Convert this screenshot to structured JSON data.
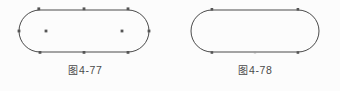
{
  "page": {
    "background_color": "#fcfcfc",
    "ink_color": "#4a4a4a",
    "marker_color": "#555555"
  },
  "figures": [
    {
      "caption_cjk": "图",
      "caption_number": "4-77",
      "caption_full": "图 4-77",
      "shape": "stadium",
      "description": "rounded-end rectangle (stadium) with boundary point markers and two interior square markers",
      "geometry": {
        "left_center_x": 40,
        "right_center_x": 128,
        "center_y": 31,
        "radius": 21,
        "stroke_width": 1
      },
      "boundary_markers": [
        {
          "name": "top-left-tangent",
          "x": 40,
          "y": 10
        },
        {
          "name": "top-middle",
          "x": 84,
          "y": 10
        },
        {
          "name": "top-right-tangent",
          "x": 128,
          "y": 10
        },
        {
          "name": "right-arc-extreme",
          "x": 149,
          "y": 31
        },
        {
          "name": "bottom-right-tangent",
          "x": 128,
          "y": 52
        },
        {
          "name": "bottom-middle",
          "x": 84,
          "y": 52
        },
        {
          "name": "bottom-left-tangent",
          "x": 40,
          "y": 52
        },
        {
          "name": "left-arc-extreme",
          "x": 19,
          "y": 31
        }
      ],
      "interior_markers": [
        {
          "name": "interior-left",
          "x": 46,
          "y": 31
        },
        {
          "name": "interior-right",
          "x": 122,
          "y": 31
        }
      ]
    },
    {
      "caption_cjk": "图",
      "caption_number": "4-78",
      "caption_full": "图 4-78",
      "shape": "stadium",
      "description": "rounded-end rectangle (stadium) with four tangent point markers and faint midline markers",
      "geometry": {
        "left_center_x": 42,
        "right_center_x": 128,
        "center_y": 31,
        "radius": 21,
        "stroke_width": 1
      },
      "boundary_markers": [
        {
          "name": "top-left-tangent",
          "x": 42,
          "y": 10
        },
        {
          "name": "top-right-tangent",
          "x": 128,
          "y": 10
        },
        {
          "name": "bottom-right-tangent",
          "x": 128,
          "y": 52
        },
        {
          "name": "bottom-left-tangent",
          "x": 42,
          "y": 52
        }
      ],
      "faint_markers": [
        {
          "name": "bottom-middle-faint",
          "x": 85,
          "y": 52
        }
      ],
      "interior_markers": []
    }
  ]
}
